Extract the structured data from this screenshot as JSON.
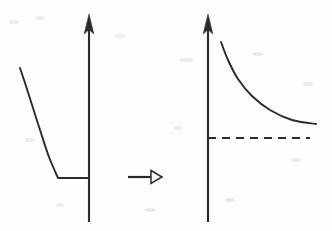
{
  "figure": {
    "title": "",
    "background_color": "#fdfdfd",
    "ink_color": "#2b2b2b",
    "width": 332,
    "height": 231
  },
  "chart_data": {
    "type": "line",
    "title": "",
    "xlabel": "",
    "ylabel": "",
    "panels": [
      {
        "name": "left-panel",
        "label": "",
        "axis": {
          "vertical_axis_x": 89,
          "vertical_axis_top": 15,
          "vertical_axis_bottom": 222,
          "arrow_direction": "up",
          "arrow_style": "solid",
          "horizontal_axis_drawn": false
        },
        "grid": false,
        "legend": null,
        "series": [
          {
            "name": "decreasing-curve-with-floor",
            "style": "solid",
            "points": [
              {
                "x": 20,
                "y": 68
              },
              {
                "x": 26,
                "y": 86
              },
              {
                "x": 33,
                "y": 108
              },
              {
                "x": 41,
                "y": 133
              },
              {
                "x": 49,
                "y": 157
              },
              {
                "x": 58,
                "y": 178
              },
              {
                "x": 89,
                "y": 178
              }
            ]
          }
        ],
        "asymptote": null
      },
      {
        "name": "right-panel",
        "label": "",
        "axis": {
          "vertical_axis_x": 208,
          "vertical_axis_top": 15,
          "vertical_axis_bottom": 222,
          "arrow_direction": "up",
          "arrow_style": "solid",
          "horizontal_axis_drawn": false
        },
        "grid": false,
        "legend": null,
        "series": [
          {
            "name": "decaying-curve-to-asymptote",
            "style": "solid",
            "points": [
              {
                "x": 221,
                "y": 42
              },
              {
                "x": 228,
                "y": 60
              },
              {
                "x": 238,
                "y": 79
              },
              {
                "x": 252,
                "y": 96
              },
              {
                "x": 270,
                "y": 110
              },
              {
                "x": 292,
                "y": 120
              },
              {
                "x": 316,
                "y": 124
              }
            ]
          }
        ],
        "asymptote": {
          "name": "horizontal-dashed-asymptote",
          "style": "dashed",
          "y": 138,
          "x_start": 208,
          "x_end": 310,
          "dash_length": 8,
          "dash_gap": 6
        }
      }
    ],
    "annotations": [
      {
        "name": "transformation-arrow",
        "type": "arrow",
        "label": "",
        "direction": "right",
        "head_style": "hollow",
        "x_start": 128,
        "x_end": 162,
        "y": 177
      }
    ]
  }
}
